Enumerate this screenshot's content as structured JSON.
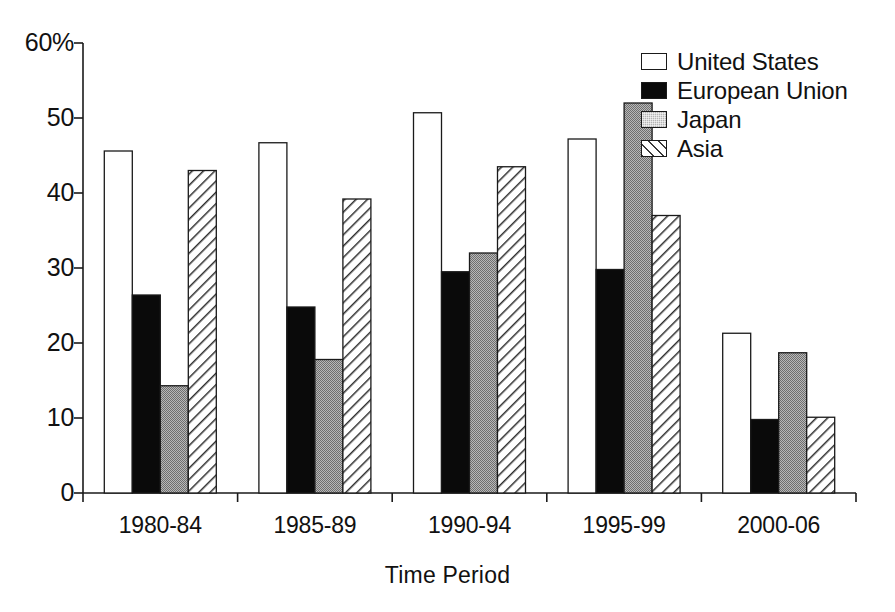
{
  "chart_data": {
    "type": "bar",
    "title": "",
    "subtitle": "",
    "xlabel": "Time Period",
    "ylabel": "",
    "categories": [
      "1980-84",
      "1985-89",
      "1990-94",
      "1995-99",
      "2000-06"
    ],
    "series": [
      {
        "name": "United States",
        "values": [
          45.6,
          46.7,
          50.7,
          47.2,
          21.3
        ]
      },
      {
        "name": "European Union",
        "values": [
          26.4,
          24.8,
          29.5,
          29.8,
          9.8
        ]
      },
      {
        "name": "Japan",
        "values": [
          14.3,
          17.8,
          32.0,
          52.0,
          18.7
        ]
      },
      {
        "name": "Asia",
        "values": [
          43.0,
          39.2,
          43.5,
          37.0,
          10.1
        ]
      }
    ],
    "ylim": [
      0,
      60
    ],
    "yticks": [
      0,
      10,
      20,
      30,
      40,
      50,
      60
    ],
    "ytick_labels": [
      "0",
      "10",
      "20",
      "30",
      "40",
      "50",
      "60%"
    ],
    "grid": false,
    "legend_position": "top-right",
    "legend_entries": [
      {
        "label": "United States",
        "fill": "white-outline",
        "color": "#ffffff"
      },
      {
        "label": "European Union",
        "fill": "solid-black",
        "color": "#0a0a0a"
      },
      {
        "label": "Japan",
        "fill": "gray-stipple",
        "color": "#b4b4b4"
      },
      {
        "label": "Asia",
        "fill": "diagonal-hatch",
        "color": "#ffffff"
      }
    ]
  },
  "axis": {
    "y_ticks": [
      {
        "label": "60%"
      },
      {
        "label": "50"
      },
      {
        "label": "40"
      },
      {
        "label": "30"
      },
      {
        "label": "20"
      },
      {
        "label": "10"
      },
      {
        "label": "0"
      }
    ],
    "x_title": "Time Period"
  }
}
